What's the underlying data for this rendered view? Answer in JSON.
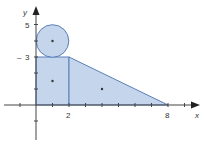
{
  "figure": {
    "axes": {
      "x_label": "x",
      "y_label": "y",
      "x_ticks": [
        "2",
        "8"
      ],
      "y_ticks": [
        "5",
        "3"
      ]
    },
    "shapes": {
      "circle": {
        "center": [
          1,
          4
        ],
        "radius": 1
      },
      "rectangle": {
        "corners": [
          [
            0,
            0
          ],
          [
            2,
            3
          ]
        ]
      },
      "triangle": {
        "vertices": [
          [
            2,
            0
          ],
          [
            2,
            3
          ],
          [
            8,
            0
          ]
        ]
      }
    },
    "centroid_dots": [
      [
        1,
        4
      ],
      [
        1,
        1.5
      ],
      [
        4,
        1
      ]
    ],
    "colors": {
      "fill": "#c5d6ec",
      "stroke": "#5a7fb8",
      "axis": "#444444"
    }
  }
}
